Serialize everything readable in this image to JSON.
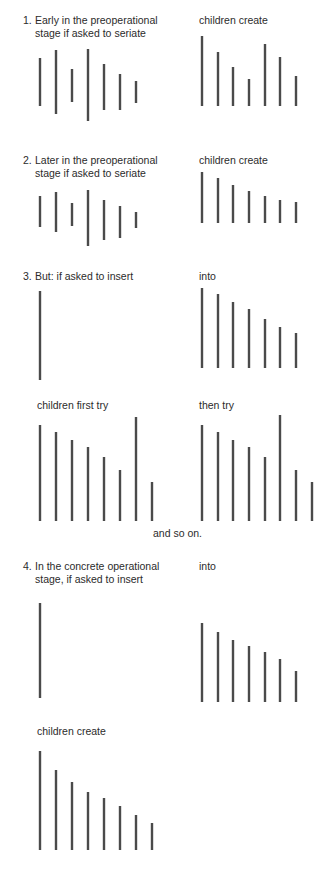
{
  "figure": {
    "sections": [
      {
        "number": "1.",
        "left_label_line1": "Early in the preoperational",
        "left_label_line2": "stage if asked to seriate",
        "right_label": "children create"
      },
      {
        "number": "2.",
        "left_label_line1": "Later in the preoperational",
        "left_label_line2": "stage if asked to seriate",
        "right_label": "children create"
      },
      {
        "number": "3.",
        "left_label_line1": "But:  if asked to insert",
        "right_label": "into",
        "sub_left_label": "children first try",
        "sub_right_label": "then try",
        "continuation": "and so on."
      },
      {
        "number": "4.",
        "left_label_line1": "In the concrete operational",
        "left_label_line2": "stage, if asked to insert",
        "right_label": "into",
        "bottom_label": "children create"
      }
    ],
    "bar_color": "#4a4a4a",
    "bar_groups": [
      {
        "name": "s1-asked-to-seriate",
        "bars": [
          [
            40,
            58,
            106
          ],
          [
            56,
            50,
            114
          ],
          [
            72,
            69,
            102
          ],
          [
            88,
            49,
            121
          ],
          [
            104,
            64,
            110
          ],
          [
            120,
            74,
            110
          ],
          [
            136,
            81,
            103
          ]
        ]
      },
      {
        "name": "s1-children-create",
        "bars": [
          [
            202,
            36,
            106
          ],
          [
            218,
            52,
            106
          ],
          [
            233,
            67,
            106
          ],
          [
            249,
            79,
            106
          ],
          [
            265,
            44,
            106
          ],
          [
            280,
            57,
            106
          ],
          [
            296,
            76,
            106
          ]
        ]
      },
      {
        "name": "s2-asked-to-seriate",
        "bars": [
          [
            40,
            196,
            227
          ],
          [
            56,
            192,
            232
          ],
          [
            72,
            203,
            226
          ],
          [
            88,
            190,
            246
          ],
          [
            104,
            200,
            240
          ],
          [
            120,
            206,
            238
          ],
          [
            136,
            212,
            228
          ]
        ]
      },
      {
        "name": "s2-children-create",
        "bars": [
          [
            202,
            172,
            223
          ],
          [
            218,
            178,
            223
          ],
          [
            233,
            185,
            223
          ],
          [
            249,
            191,
            223
          ],
          [
            265,
            196,
            223
          ],
          [
            280,
            200,
            223
          ],
          [
            296,
            202,
            223
          ]
        ]
      },
      {
        "name": "s3-insert-stick",
        "bars": [
          [
            40,
            291,
            380
          ]
        ]
      },
      {
        "name": "s3-into-series",
        "bars": [
          [
            202,
            288,
            368
          ],
          [
            218,
            294,
            368
          ],
          [
            233,
            302,
            368
          ],
          [
            249,
            309,
            368
          ],
          [
            265,
            319,
            368
          ],
          [
            280,
            327,
            368
          ],
          [
            296,
            333,
            368
          ]
        ]
      },
      {
        "name": "s3-children-first-try",
        "bars": [
          [
            40,
            425,
            521
          ],
          [
            56,
            432,
            521
          ],
          [
            72,
            440,
            521
          ],
          [
            88,
            447,
            521
          ],
          [
            104,
            457,
            521
          ],
          [
            120,
            470,
            521
          ],
          [
            136,
            417,
            521
          ],
          [
            152,
            482,
            521
          ]
        ]
      },
      {
        "name": "s3-then-try",
        "bars": [
          [
            202,
            425,
            521
          ],
          [
            218,
            432,
            521
          ],
          [
            233,
            440,
            521
          ],
          [
            249,
            447,
            521
          ],
          [
            265,
            457,
            521
          ],
          [
            280,
            415,
            521
          ],
          [
            296,
            470,
            521
          ],
          [
            312,
            482,
            521
          ]
        ]
      },
      {
        "name": "s4-insert-stick",
        "bars": [
          [
            40,
            603,
            698
          ]
        ]
      },
      {
        "name": "s4-into-series",
        "bars": [
          [
            202,
            623,
            702
          ],
          [
            218,
            632,
            702
          ],
          [
            233,
            640,
            702
          ],
          [
            249,
            646,
            702
          ],
          [
            265,
            652,
            702
          ],
          [
            280,
            659,
            702
          ],
          [
            296,
            671,
            702
          ]
        ]
      },
      {
        "name": "s4-children-create",
        "bars": [
          [
            40,
            751,
            850
          ],
          [
            56,
            770,
            850
          ],
          [
            72,
            782,
            850
          ],
          [
            88,
            792,
            850
          ],
          [
            104,
            798,
            850
          ],
          [
            120,
            806,
            850
          ],
          [
            136,
            815,
            850
          ],
          [
            152,
            823,
            850
          ]
        ]
      }
    ]
  }
}
